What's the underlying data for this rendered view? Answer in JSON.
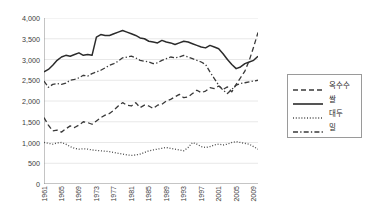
{
  "chart_data": {
    "type": "line",
    "title": "",
    "subtitle": "",
    "xlabel": "",
    "ylabel": "",
    "grid": "horizontal",
    "legend_position": "right",
    "ylim": [
      0,
      4000
    ],
    "yticks": [
      0,
      500,
      1000,
      1500,
      2000,
      2500,
      3000,
      3500,
      4000
    ],
    "ytick_labels": [
      "0",
      "500",
      "1,000",
      "1,500",
      "2,000",
      "2,500",
      "3,000",
      "3,500",
      "4,000"
    ],
    "xlim": [
      1961,
      2010
    ],
    "x": [
      1961,
      1962,
      1963,
      1964,
      1965,
      1966,
      1967,
      1968,
      1969,
      1970,
      1971,
      1972,
      1973,
      1974,
      1975,
      1976,
      1977,
      1978,
      1979,
      1980,
      1981,
      1982,
      1983,
      1984,
      1985,
      1986,
      1987,
      1988,
      1989,
      1990,
      1991,
      1992,
      1993,
      1994,
      1995,
      1996,
      1997,
      1998,
      1999,
      2000,
      2001,
      2002,
      2003,
      2004,
      2005,
      2006,
      2007,
      2008,
      2009,
      2010
    ],
    "xtick_labels": [
      "1961",
      "1965",
      "1969",
      "1973",
      "1977",
      "1981",
      "1985",
      "1989",
      "1993",
      "1997",
      "2001",
      "2005",
      "2009"
    ],
    "xtick_years": [
      1961,
      1965,
      1969,
      1973,
      1977,
      1981,
      1985,
      1989,
      1993,
      1997,
      2001,
      2005,
      2009
    ],
    "series": [
      {
        "name": "옥수수",
        "style": "dashed",
        "color": "#3a3a3a",
        "values": [
          1600,
          1420,
          1280,
          1300,
          1250,
          1330,
          1400,
          1360,
          1420,
          1500,
          1480,
          1440,
          1520,
          1600,
          1660,
          1700,
          1780,
          1880,
          1960,
          1900,
          1880,
          1960,
          1840,
          1900,
          1880,
          1820,
          1900,
          1920,
          2000,
          2040,
          2100,
          2160,
          2080,
          2100,
          2180,
          2260,
          2200,
          2240,
          2320,
          2300,
          2360,
          2280,
          2340,
          2220,
          2400,
          2560,
          2720,
          2980,
          3300,
          3650
        ]
      },
      {
        "name": "쌀",
        "style": "solid",
        "color": "#2b2b2b",
        "values": [
          2700,
          2760,
          2860,
          2980,
          3060,
          3100,
          3080,
          3120,
          3160,
          3100,
          3120,
          3100,
          3540,
          3600,
          3580,
          3580,
          3620,
          3660,
          3700,
          3660,
          3620,
          3580,
          3520,
          3500,
          3440,
          3420,
          3400,
          3460,
          3420,
          3400,
          3360,
          3400,
          3440,
          3420,
          3380,
          3340,
          3300,
          3280,
          3340,
          3300,
          3260,
          3140,
          3000,
          2880,
          2780,
          2820,
          2900,
          2940,
          2980,
          3080
        ]
      },
      {
        "name": "대두",
        "style": "dotted",
        "color": "#4a4a4a",
        "values": [
          1000,
          980,
          960,
          990,
          1000,
          960,
          900,
          860,
          840,
          850,
          840,
          820,
          810,
          800,
          790,
          780,
          760,
          740,
          720,
          700,
          690,
          700,
          720,
          760,
          800,
          820,
          840,
          860,
          880,
          860,
          840,
          820,
          800,
          880,
          1000,
          960,
          900,
          880,
          900,
          940,
          960,
          940,
          960,
          1000,
          1020,
          1000,
          980,
          960,
          900,
          840
        ]
      },
      {
        "name": "밀",
        "style": "dashdot",
        "color": "#3a3a3a",
        "values": [
          2480,
          2330,
          2400,
          2420,
          2400,
          2430,
          2500,
          2520,
          2560,
          2620,
          2600,
          2660,
          2700,
          2740,
          2800,
          2860,
          2900,
          2960,
          3040,
          3060,
          3080,
          3040,
          2980,
          2960,
          2940,
          2900,
          2920,
          2980,
          3020,
          3060,
          3040,
          3060,
          3100,
          3060,
          3020,
          2980,
          2940,
          2880,
          2700,
          2540,
          2380,
          2260,
          2180,
          2280,
          2380,
          2420,
          2440,
          2460,
          2480,
          2500
        ]
      }
    ]
  },
  "legend": {
    "items": [
      {
        "label": "옥수수",
        "style": "dashed"
      },
      {
        "label": "쌀",
        "style": "solid"
      },
      {
        "label": "대두",
        "style": "dotted"
      },
      {
        "label": "밀",
        "style": "dashdot"
      }
    ]
  },
  "colors": {
    "background": "#ffffff",
    "axis": "#8a8a8a",
    "grid": "#e8e8e8",
    "text": "#3b3b3b",
    "legend_border": "#9a9a9a"
  }
}
